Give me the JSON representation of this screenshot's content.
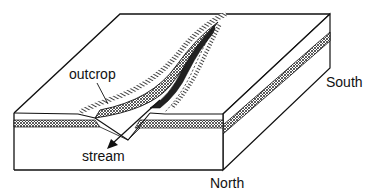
{
  "diagram": {
    "type": "block-diagram",
    "labels": {
      "outcrop": "outcrop",
      "stream": "stream",
      "south": "South",
      "north": "North"
    },
    "colors": {
      "line": "#111111",
      "background": "#ffffff",
      "layer_fill": "#9a9a9a"
    }
  }
}
